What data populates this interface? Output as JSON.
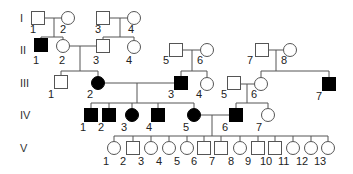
{
  "diagram": {
    "type": "pedigree",
    "generations": [
      {
        "id": "I",
        "label": "I",
        "y": 18
      },
      {
        "id": "II",
        "label": "II",
        "y": 50
      },
      {
        "id": "III",
        "label": "III",
        "y": 83
      },
      {
        "id": "IV",
        "label": "IV",
        "y": 115
      },
      {
        "id": "V",
        "label": "V",
        "y": 148
      }
    ],
    "individuals": [
      {
        "id": "I-1",
        "label": "1",
        "sex": "male",
        "affected": false,
        "x": 38,
        "y": 18,
        "lx": 30,
        "ly": 33
      },
      {
        "id": "I-2",
        "label": "2",
        "sex": "female",
        "affected": false,
        "x": 68,
        "y": 18,
        "lx": 60,
        "ly": 33
      },
      {
        "id": "I-3",
        "label": "3",
        "sex": "male",
        "affected": false,
        "x": 103,
        "y": 18,
        "lx": 95,
        "ly": 33
      },
      {
        "id": "I-4",
        "label": "4",
        "sex": "female",
        "affected": false,
        "x": 134,
        "y": 18,
        "lx": 128,
        "ly": 33
      },
      {
        "id": "II-1",
        "label": "1",
        "sex": "male",
        "affected": true,
        "x": 41,
        "y": 45,
        "lx": 33,
        "ly": 64
      },
      {
        "id": "II-2",
        "label": "2",
        "sex": "female",
        "affected": false,
        "x": 63,
        "y": 46,
        "lx": 59,
        "ly": 64
      },
      {
        "id": "II-3",
        "label": "3",
        "sex": "male",
        "affected": false,
        "x": 103,
        "y": 46,
        "lx": 93,
        "ly": 64
      },
      {
        "id": "II-4",
        "label": "4",
        "sex": "female",
        "affected": false,
        "x": 134,
        "y": 47,
        "lx": 126,
        "ly": 64
      },
      {
        "id": "II-5",
        "label": "5",
        "sex": "male",
        "affected": false,
        "x": 176,
        "y": 50,
        "lx": 163,
        "ly": 64
      },
      {
        "id": "II-6",
        "label": "6",
        "sex": "female",
        "affected": false,
        "x": 207,
        "y": 50,
        "lx": 197,
        "ly": 64
      },
      {
        "id": "II-7",
        "label": "7",
        "sex": "male",
        "affected": false,
        "x": 262,
        "y": 50,
        "lx": 247,
        "ly": 64
      },
      {
        "id": "II-8",
        "label": "8",
        "sex": "female",
        "affected": false,
        "x": 290,
        "y": 50,
        "lx": 281,
        "ly": 64
      },
      {
        "id": "III-1",
        "label": "1",
        "sex": "male",
        "affected": false,
        "x": 61,
        "y": 82,
        "lx": 48,
        "ly": 98
      },
      {
        "id": "III-2",
        "label": "2",
        "sex": "female",
        "affected": true,
        "x": 98,
        "y": 83,
        "lx": 87,
        "ly": 98
      },
      {
        "id": "III-3",
        "label": "3",
        "sex": "male",
        "affected": true,
        "x": 181,
        "y": 83,
        "lx": 168,
        "ly": 98
      },
      {
        "id": "III-4",
        "label": "4",
        "sex": "female",
        "affected": false,
        "x": 207,
        "y": 84,
        "lx": 196,
        "ly": 98
      },
      {
        "id": "III-5",
        "label": "5",
        "sex": "male",
        "affected": false,
        "x": 234,
        "y": 83,
        "lx": 221,
        "ly": 98
      },
      {
        "id": "III-6",
        "label": "6",
        "sex": "female",
        "affected": false,
        "x": 261,
        "y": 84,
        "lx": 251,
        "ly": 98
      },
      {
        "id": "III-7",
        "label": "7",
        "sex": "male",
        "affected": true,
        "x": 329,
        "y": 84,
        "lx": 316,
        "ly": 100
      },
      {
        "id": "IV-1",
        "label": "1",
        "sex": "male",
        "affected": true,
        "x": 91,
        "y": 115,
        "lx": 80,
        "ly": 131
      },
      {
        "id": "IV-2",
        "label": "2",
        "sex": "male",
        "affected": true,
        "x": 109,
        "y": 115,
        "lx": 98,
        "ly": 131
      },
      {
        "id": "IV-3",
        "label": "3",
        "sex": "female",
        "affected": true,
        "x": 132,
        "y": 115,
        "lx": 121,
        "ly": 131
      },
      {
        "id": "IV-4",
        "label": "4",
        "sex": "male",
        "affected": true,
        "x": 158,
        "y": 115,
        "lx": 146,
        "ly": 131
      },
      {
        "id": "IV-5",
        "label": "5",
        "sex": "female",
        "affected": true,
        "x": 194,
        "y": 115,
        "lx": 183,
        "ly": 131
      },
      {
        "id": "IV-6",
        "label": "6",
        "sex": "male",
        "affected": true,
        "x": 236,
        "y": 115,
        "lx": 222,
        "ly": 131
      },
      {
        "id": "IV-7",
        "label": "7",
        "sex": "female",
        "affected": false,
        "x": 268,
        "y": 115,
        "lx": 256,
        "ly": 131
      },
      {
        "id": "V-1",
        "label": "1",
        "sex": "female",
        "affected": false,
        "x": 114,
        "y": 148,
        "lx": 103,
        "ly": 165
      },
      {
        "id": "V-2",
        "label": "2",
        "sex": "male",
        "affected": false,
        "x": 133,
        "y": 148,
        "lx": 120,
        "ly": 165
      },
      {
        "id": "V-3",
        "label": "3",
        "sex": "female",
        "affected": false,
        "x": 151,
        "y": 148,
        "lx": 138,
        "ly": 165
      },
      {
        "id": "V-4",
        "label": "4",
        "sex": "female",
        "affected": false,
        "x": 169,
        "y": 148,
        "lx": 156,
        "ly": 165
      },
      {
        "id": "V-5",
        "label": "5",
        "sex": "female",
        "affected": false,
        "x": 187,
        "y": 148,
        "lx": 174,
        "ly": 165
      },
      {
        "id": "V-6",
        "label": "6",
        "sex": "male",
        "affected": false,
        "x": 204,
        "y": 148,
        "lx": 191,
        "ly": 165
      },
      {
        "id": "V-7",
        "label": "7",
        "sex": "male",
        "affected": false,
        "x": 221,
        "y": 148,
        "lx": 209,
        "ly": 165
      },
      {
        "id": "V-8",
        "label": "8",
        "sex": "female",
        "affected": false,
        "x": 240,
        "y": 148,
        "lx": 228,
        "ly": 165
      },
      {
        "id": "V-9",
        "label": "9",
        "sex": "male",
        "affected": false,
        "x": 258,
        "y": 148,
        "lx": 245,
        "ly": 165
      },
      {
        "id": "V-10",
        "label": "10",
        "sex": "male",
        "affected": false,
        "x": 275,
        "y": 148,
        "lx": 260,
        "ly": 165
      },
      {
        "id": "V-11",
        "label": "11",
        "sex": "female",
        "affected": false,
        "x": 293,
        "y": 148,
        "lx": 278,
        "ly": 165
      },
      {
        "id": "V-12",
        "label": "12",
        "sex": "female",
        "affected": false,
        "x": 311,
        "y": 148,
        "lx": 296,
        "ly": 165
      },
      {
        "id": "V-13",
        "label": "13",
        "sex": "female",
        "affected": false,
        "x": 328,
        "y": 148,
        "lx": 314,
        "ly": 165
      }
    ],
    "lines": [
      [
        44,
        18,
        61,
        18
      ],
      [
        54,
        18,
        54,
        37
      ],
      [
        41,
        37,
        63,
        37
      ],
      [
        41,
        37,
        41,
        39
      ],
      [
        63,
        37,
        63,
        40
      ],
      [
        109,
        18,
        127,
        18
      ],
      [
        120,
        18,
        120,
        37
      ],
      [
        103,
        37,
        134,
        37
      ],
      [
        103,
        37,
        103,
        40
      ],
      [
        134,
        37,
        134,
        40
      ],
      [
        70,
        46,
        97,
        46
      ],
      [
        80,
        46,
        80,
        71
      ],
      [
        61,
        71,
        98,
        71
      ],
      [
        61,
        71,
        61,
        76
      ],
      [
        98,
        71,
        98,
        76
      ],
      [
        182,
        50,
        200,
        50
      ],
      [
        192,
        50,
        192,
        71
      ],
      [
        181,
        71,
        207,
        71
      ],
      [
        181,
        71,
        181,
        77
      ],
      [
        207,
        71,
        207,
        77
      ],
      [
        268,
        50,
        283,
        50
      ],
      [
        276,
        50,
        276,
        71
      ],
      [
        261,
        71,
        329,
        71
      ],
      [
        261,
        71,
        261,
        77
      ],
      [
        329,
        71,
        329,
        78
      ],
      [
        105,
        83,
        175,
        83
      ],
      [
        137,
        83,
        137,
        103
      ],
      [
        91,
        103,
        194,
        103
      ],
      [
        91,
        103,
        91,
        109
      ],
      [
        109,
        103,
        109,
        109
      ],
      [
        132,
        103,
        132,
        108
      ],
      [
        158,
        103,
        158,
        109
      ],
      [
        194,
        103,
        194,
        108
      ],
      [
        240,
        84,
        254,
        84
      ],
      [
        247,
        84,
        247,
        103
      ],
      [
        236,
        103,
        268,
        103
      ],
      [
        236,
        103,
        236,
        109
      ],
      [
        268,
        103,
        268,
        108
      ],
      [
        201,
        115,
        230,
        115
      ],
      [
        212,
        115,
        212,
        136
      ],
      [
        114,
        136,
        328,
        136
      ],
      [
        114,
        136,
        114,
        141
      ],
      [
        133,
        136,
        133,
        142
      ],
      [
        151,
        136,
        151,
        141
      ],
      [
        169,
        136,
        169,
        141
      ],
      [
        187,
        136,
        187,
        141
      ],
      [
        204,
        136,
        204,
        142
      ],
      [
        221,
        136,
        221,
        142
      ],
      [
        240,
        136,
        240,
        141
      ],
      [
        258,
        136,
        258,
        142
      ],
      [
        275,
        136,
        275,
        142
      ],
      [
        293,
        136,
        293,
        141
      ],
      [
        311,
        136,
        311,
        141
      ],
      [
        328,
        136,
        328,
        141
      ]
    ],
    "legend": {
      "symbol_size": 13
    }
  }
}
